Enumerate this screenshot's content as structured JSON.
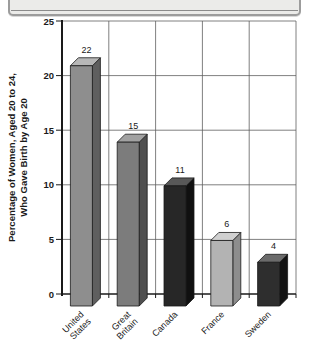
{
  "page": {
    "background": "#ffffff"
  },
  "top_panel": {
    "description": "bottom edge of cut-off beveled box above chart",
    "fill": "#ebebe9",
    "border_color": "#9c9c9c",
    "inner_line_color": "#8b8b8b"
  },
  "chart_data": {
    "type": "bar",
    "style": "3d-column",
    "title": "",
    "categories": [
      "United States",
      "Great Britain",
      "Canada",
      "France",
      "Sweden"
    ],
    "category_label_lines": [
      [
        "United",
        "States"
      ],
      [
        "Great",
        "Britain"
      ],
      [
        "Canada"
      ],
      [
        "France"
      ],
      [
        "Sweden"
      ]
    ],
    "values": [
      22,
      15,
      11,
      6,
      4
    ],
    "value_labels": [
      "22",
      "15",
      "11",
      "6",
      "4"
    ],
    "xlabel": "",
    "ylabel": "Percentage of Women, Aged 20 to 24, Who Gave Birth by Age 20",
    "ylabel_lines": [
      "Percentage of Women, Aged 20 to 24,",
      "Who Gave Birth by Age 20"
    ],
    "ylim": [
      0,
      25
    ],
    "yticks": [
      0,
      5,
      10,
      15,
      20,
      25
    ],
    "grid": true,
    "legend": "none",
    "axis_color": "#1a1a1a",
    "grid_color": "#606060",
    "text_color": "#1a1a1a",
    "bar_colors": [
      {
        "front": "#8e8e8e",
        "top": "#b7b7b7",
        "side": "#5f5f5f"
      },
      {
        "front": "#7c7c7c",
        "top": "#a2a2a2",
        "side": "#4f4f4f"
      },
      {
        "front": "#272727",
        "top": "#585858",
        "side": "#101010"
      },
      {
        "front": "#b3b3b3",
        "top": "#d0d0d0",
        "side": "#8d8d8d"
      },
      {
        "front": "#2e2e2e",
        "top": "#6b6b6b",
        "side": "#121212"
      }
    ]
  }
}
